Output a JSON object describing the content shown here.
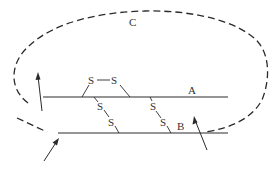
{
  "diagram": {
    "title": "",
    "labels": {
      "chain_a": "A",
      "chain_b": "B",
      "loop_c": "C",
      "sulfur": "S"
    },
    "elements": {
      "chain_a": "horizontal solid line labeled A",
      "chain_b": "horizontal solid line labeled B",
      "loop_c": "dashed loop labeled C connecting ends",
      "disulfide_bonds": [
        {
          "type": "intrachain",
          "chain": "A",
          "atoms": [
            "S",
            "S"
          ]
        },
        {
          "type": "interchain",
          "chains": [
            "A",
            "B"
          ],
          "atoms": [
            "S",
            "S"
          ]
        },
        {
          "type": "interchain",
          "chains": [
            "A",
            "B"
          ],
          "atoms": [
            "S",
            "S"
          ]
        }
      ],
      "arrows": 3
    },
    "colors": {
      "stroke": "#2a2a2a",
      "background": "#ffffff"
    }
  }
}
